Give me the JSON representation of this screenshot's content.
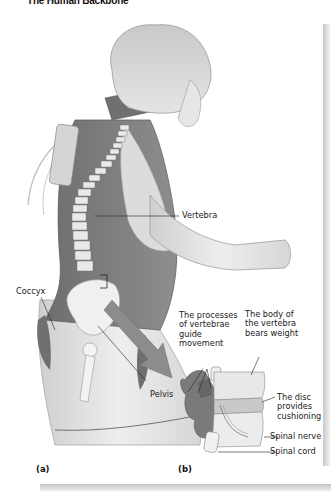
{
  "figure": {
    "title": "The Human Backbone",
    "panels": [
      {
        "id": "a",
        "label": "(a)"
      },
      {
        "id": "b",
        "label": "(b)"
      }
    ],
    "labels": {
      "vertebra": "Vertebra",
      "coccyx": "Coccyx",
      "pelvis": "Pelvis",
      "processes": "The processes\nof vertebrae\nguide\nmovement",
      "body": "The body of\nthe vertebra\nbears weight",
      "disc": "The disc\nprovides\ncushioning",
      "spinal_nerve": "Spinal nerve",
      "spinal_cord": "Spinal cord"
    },
    "colors": {
      "illustration_gray": "#9a9a9a",
      "dark_tissue": "#7d7d7d",
      "bone": "#e2e2e2",
      "text": "#1a1a1a",
      "shadow": "#c8c8c8"
    }
  }
}
